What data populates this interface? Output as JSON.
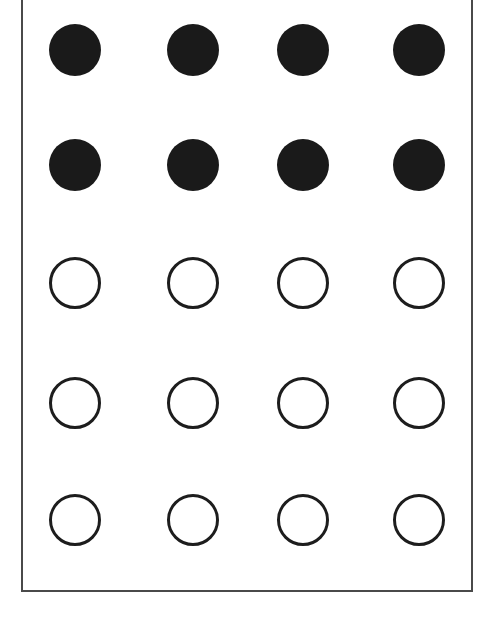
{
  "figure": {
    "title": "",
    "background_color": "#ffffff",
    "frame": {
      "border_color": "#4a4a4a",
      "border_width_px": 2,
      "x": 21,
      "y": -6,
      "width": 452,
      "height": 598,
      "note": "top edge cropped above image boundary"
    }
  },
  "chart_data": {
    "type": "scatter",
    "title": "",
    "xlabel": "",
    "ylabel": "",
    "grid": false,
    "legend": null,
    "rows": 5,
    "columns": 4,
    "filled_color": "#1a1a1a",
    "open_color": "#ffffff",
    "open_stroke_color": "#1d1d1d",
    "column_centers_px": [
      75,
      193,
      303,
      419
    ],
    "row_centers_px": [
      50,
      165,
      283,
      403,
      520
    ],
    "marker_diameter_px": 52,
    "states": [
      [
        "filled",
        "filled",
        "filled",
        "filled"
      ],
      [
        "filled",
        "filled",
        "filled",
        "filled"
      ],
      [
        "open",
        "open",
        "open",
        "open"
      ],
      [
        "open",
        "open",
        "open",
        "open"
      ],
      [
        "open",
        "open",
        "open",
        "open"
      ]
    ],
    "counts": {
      "filled": 8,
      "open": 12,
      "total": 20
    }
  }
}
